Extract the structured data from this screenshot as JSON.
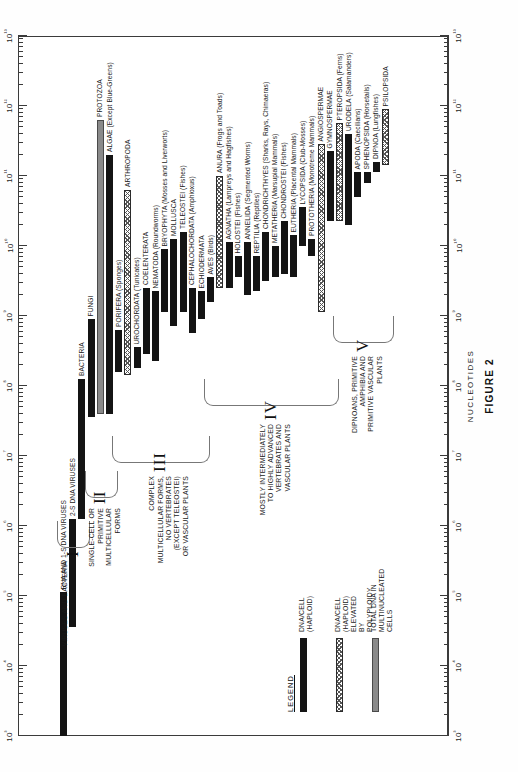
{
  "figure": {
    "number_label": "FIGURE 2",
    "x_axis_title": "NUCLEOTIDES",
    "decade_labels": [
      "10³",
      "10⁴",
      "10⁵",
      "10⁶",
      "10⁷",
      "10⁸",
      "10⁹",
      "10¹⁰",
      "10¹¹",
      "10¹²",
      "10¹³"
    ]
  },
  "legend": {
    "title": "LEGEND",
    "items": [
      {
        "swatch": "solid",
        "label": "DNA/CELL (HAPLOID)"
      },
      {
        "swatch": "poly",
        "label": "DNA/CELL (HAPLOID) ELEVATED\nBY POLYPLOIDY"
      },
      {
        "swatch": "multi",
        "label": "TOTAL DNA IN MULTINUCLEATED CELLS"
      }
    ]
  },
  "groups": [
    {
      "numeral": "I",
      "description": "VIRUSES AND BACTERIA"
    },
    {
      "numeral": "II",
      "description": "SINGLE-CELL OR\nPRIMITIVE MULTICELLULAR\nFORMS"
    },
    {
      "numeral": "III",
      "description": "COMPLEX MULTICELLULAR FORMS,\nNO VERTEBRATES (EXCEPT TELEOSTEI)\nOR VASCULAR PLANTS"
    },
    {
      "numeral": "IV",
      "description": "MOSTLY INTERMEDIATELY\nTO HIGHLY ADVANCED\nVERTEBRATES AND VASCULAR PLANTS"
    },
    {
      "numeral": "V",
      "description": "DIPNOANS, PRIMITIVE AMPHIBIA AND\nPRIMITIVE VASCULAR PLANTS"
    }
  ],
  "chart_data": {
    "type": "bar",
    "title": "FIGURE 2",
    "xlabel": "NUCLEOTIDES",
    "ylabel": "",
    "scale": "log10",
    "xlim": [
      1000,
      10000000000000
    ],
    "xlim_exponents": [
      3,
      13
    ],
    "grid": false,
    "legend_position": "lower-left",
    "orientation": "horizontal-ranges",
    "series_types": {
      "solid": "DNA/CELL (HAPLOID)",
      "poly": "DNA/CELL (HAPLOID) ELEVATED BY POLYPLOIDY",
      "multi": "TOTAL DNA IN MULTINUCLEATED CELLS"
    },
    "bars": [
      {
        "label": "RNA AND 1-S DNA VIRUSES",
        "group": "I",
        "type": "solid",
        "x0_exp": 3.0,
        "x1_exp": 5.05,
        "label_side": "right"
      },
      {
        "label": "2-S DNA VIRUSES",
        "group": "I",
        "type": "solid",
        "x0_exp": 4.55,
        "x1_exp": 6.1,
        "label_side": "right"
      },
      {
        "label": "BACTERIA",
        "group": "I",
        "type": "solid",
        "x0_exp": 6.1,
        "x1_exp": 8.1,
        "label_side": "right"
      },
      {
        "label": "FUNGI",
        "group": "II",
        "type": "solid",
        "x0_exp": 7.55,
        "x1_exp": 8.95,
        "label_side": "right"
      },
      {
        "label": "PROTOZOA",
        "group": "II",
        "type": "multi",
        "x0_exp": 7.6,
        "x1_exp": 11.8,
        "label_side": "right"
      },
      {
        "label": "ALGAE (Except Blue-Greens)",
        "group": "II",
        "type": "solid",
        "x0_exp": 7.6,
        "x1_exp": 11.3,
        "label_side": "right"
      },
      {
        "label": "PORIFERA (Sponges)",
        "group": "III",
        "type": "solid",
        "x0_exp": 8.2,
        "x1_exp": 8.8,
        "label_side": "right"
      },
      {
        "label": "ARTHROPODA",
        "group": "III",
        "type": "poly",
        "x0_exp": 8.15,
        "x1_exp": 10.8,
        "label_side": "right"
      },
      {
        "label": "UROCHORDATA (Tunicates)",
        "group": "III",
        "type": "solid",
        "x0_exp": 8.25,
        "x1_exp": 8.55,
        "label_side": "right"
      },
      {
        "label": "COELENTERATA",
        "group": "III",
        "type": "solid",
        "x0_exp": 8.45,
        "x1_exp": 9.4,
        "label_side": "right"
      },
      {
        "label": "NEMATODA (Roundworms)",
        "group": "III",
        "type": "solid",
        "x0_exp": 8.35,
        "x1_exp": 9.35,
        "label_side": "right"
      },
      {
        "label": "BRYOPHYTA (Mosses and Liverworts)",
        "group": "III",
        "type": "solid",
        "x0_exp": 9.05,
        "x1_exp": 9.95,
        "label_side": "right"
      },
      {
        "label": "MOLLUSCA",
        "group": "III",
        "type": "solid",
        "x0_exp": 8.85,
        "x1_exp": 10.1,
        "label_side": "right"
      },
      {
        "label": "TELEOSTEI (Fishes)",
        "group": "III",
        "type": "solid",
        "x0_exp": 9.05,
        "x1_exp": 10.2,
        "label_side": "right"
      },
      {
        "label": "CEPHALOCHORDATA (Amphioxus)",
        "group": "III",
        "type": "solid",
        "x0_exp": 8.75,
        "x1_exp": 9.4,
        "label_side": "right"
      },
      {
        "label": "ECHIODERMATA",
        "group": "III",
        "type": "solid",
        "x0_exp": 8.95,
        "x1_exp": 9.35,
        "label_side": "right"
      },
      {
        "label": "AVES (Birds)",
        "group": "IV",
        "type": "solid",
        "x0_exp": 9.2,
        "x1_exp": 9.55,
        "label_side": "right"
      },
      {
        "label": "ANURA (Frogs and Toads)",
        "group": "IV",
        "type": "poly",
        "x0_exp": 9.4,
        "x1_exp": 11.0,
        "label_side": "right"
      },
      {
        "label": "AGNATHA (Lampreys and Hagfishes)",
        "group": "IV",
        "type": "solid",
        "x0_exp": 9.4,
        "x1_exp": 10.05,
        "label_side": "right"
      },
      {
        "label": "HOLOSTEI (Fishes)",
        "group": "IV",
        "type": "solid",
        "x0_exp": 9.55,
        "x1_exp": 9.85,
        "label_side": "right"
      },
      {
        "label": "ANNELIDA (Segmented Worms)",
        "group": "IV",
        "type": "solid",
        "x0_exp": 9.3,
        "x1_exp": 10.05,
        "label_side": "right"
      },
      {
        "label": "REPTILIA (Reptiles)",
        "group": "IV",
        "type": "solid",
        "x0_exp": 9.35,
        "x1_exp": 9.85,
        "label_side": "right"
      },
      {
        "label": "CHONDRICHTHYES (Sharks, Rays, Chimaeras)",
        "group": "IV",
        "type": "solid",
        "x0_exp": 9.5,
        "x1_exp": 10.2,
        "label_side": "right"
      },
      {
        "label": "METATHERIA (Marsupial Mammals)",
        "group": "IV",
        "type": "solid",
        "x0_exp": 9.55,
        "x1_exp": 10.0,
        "label_side": "right"
      },
      {
        "label": "CHONDROSTEI (Fishes)",
        "group": "IV",
        "type": "solid",
        "x0_exp": 9.6,
        "x1_exp": 10.35,
        "label_side": "right"
      },
      {
        "label": "EUTHERIA (Placental Mammals)",
        "group": "IV",
        "type": "solid",
        "x0_exp": 9.55,
        "x1_exp": 10.15,
        "label_side": "right"
      },
      {
        "label": "LYCOPSIDA (Club-Mosses)",
        "group": "IV",
        "type": "solid",
        "x0_exp": 10.0,
        "x1_exp": 10.55,
        "label_side": "right"
      },
      {
        "label": "PROTOTHERIA (Monotreme Mammals)",
        "group": "IV",
        "type": "solid",
        "x0_exp": 9.85,
        "x1_exp": 10.1,
        "label_side": "right"
      },
      {
        "label": "ANGIOSPERMAE",
        "group": "IV",
        "type": "poly",
        "x0_exp": 9.05,
        "x1_exp": 11.45,
        "label_side": "right"
      },
      {
        "label": "GYMNOSPERMAE",
        "group": "IV",
        "type": "solid",
        "x0_exp": 10.35,
        "x1_exp": 11.35,
        "label_side": "right"
      },
      {
        "label": "PTEROPSIDA (Ferns)",
        "group": "V",
        "type": "poly",
        "x0_exp": 10.35,
        "x1_exp": 11.75,
        "label_side": "right"
      },
      {
        "label": "URODELA (Salamanders)",
        "group": "V",
        "type": "solid",
        "x0_exp": 10.3,
        "x1_exp": 11.6,
        "label_side": "right"
      },
      {
        "label": "APODA (Caecilians)",
        "group": "V",
        "type": "solid",
        "x0_exp": 10.7,
        "x1_exp": 11.05,
        "label_side": "right"
      },
      {
        "label": "SPHENOPSIDA (Horsetails)",
        "group": "V",
        "type": "solid",
        "x0_exp": 10.9,
        "x1_exp": 11.05,
        "label_side": "right"
      },
      {
        "label": "DIPNOA (Lungfishes)",
        "group": "V",
        "type": "solid",
        "x0_exp": 11.05,
        "x1_exp": 11.2,
        "label_side": "right"
      },
      {
        "label": "PSILOPSIDA",
        "group": "V",
        "type": "poly",
        "x0_exp": 11.15,
        "x1_exp": 11.95,
        "label_side": "right"
      }
    ]
  }
}
